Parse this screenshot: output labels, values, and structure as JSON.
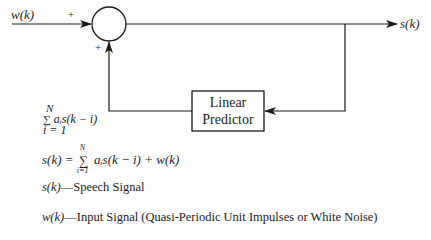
{
  "diagram": {
    "type": "block-diagram",
    "nodes": [
      {
        "id": "summer",
        "shape": "circle",
        "label": ""
      },
      {
        "id": "predictor",
        "shape": "rectangle",
        "label_lines": [
          "Linear",
          "Predictor"
        ]
      }
    ],
    "edges": [
      {
        "from": "w(k)",
        "to": "summer",
        "sign": "+"
      },
      {
        "from": "predictor",
        "to": "summer",
        "sign": "+"
      },
      {
        "from": "summer",
        "to": "s(k)"
      },
      {
        "from": "s(k) branch",
        "to": "predictor"
      }
    ]
  },
  "labels": {
    "input": "w(k)",
    "output": "s(k)",
    "plus_top": "+",
    "plus_bottom": "+",
    "box_line1": "Linear",
    "box_line2": "Predictor",
    "sum_upper": "N",
    "sum_sigma": "∑",
    "sum_term": "aᵢs(k − i)",
    "sum_lower": "i = 1"
  },
  "equation": {
    "lhs": "s(k) = ",
    "sigma": "∑",
    "upper": "N",
    "lower": "i=1",
    "rhs": " aᵢs(k − i) + w(k)"
  },
  "definitions": [
    {
      "symbol": "s(k)",
      "text": "—Speech Signal"
    },
    {
      "symbol": "w(k)",
      "text": "—Input Signal (Quasi-Periodic Unit Impulses or White Noise)"
    }
  ]
}
